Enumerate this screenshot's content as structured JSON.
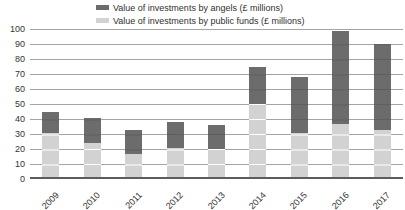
{
  "chart_data": {
    "type": "bar",
    "stacked": true,
    "title": "",
    "categories": [
      "2009",
      "2010",
      "2011",
      "2012",
      "2013",
      "2014",
      "2015",
      "2016",
      "2017"
    ],
    "series": [
      {
        "name": "Value of investments by angels (£ millions)",
        "values": [
          14,
          17,
          16,
          17,
          16,
          25,
          37,
          62,
          57
        ],
        "color": "#6c6c6c",
        "stack": "top"
      },
      {
        "name": "Value of investments by public funds (£ millions)",
        "values": [
          31,
          24,
          17,
          21,
          20,
          50,
          31,
          37,
          33
        ],
        "color": "#d2d2d2",
        "stack": "bottom"
      }
    ],
    "totals": [
      45,
      41,
      33,
      38,
      36,
      75,
      68,
      99,
      90
    ],
    "xlabel": "",
    "ylabel": "",
    "ylim": [
      0,
      100
    ],
    "ytick_interval": 10,
    "y_ticks": [
      "0",
      "10",
      "20",
      "30",
      "40",
      "50",
      "60",
      "70",
      "80",
      "90",
      "100"
    ],
    "legend_position": "top",
    "grid": true
  },
  "colors": {
    "bar_angels": "#6c6c6c",
    "bar_public": "#d2d2d2",
    "gridline": "#a4a4a4",
    "axis_line": "#5c5c5c",
    "text": "#333333",
    "background": "#ffffff"
  }
}
